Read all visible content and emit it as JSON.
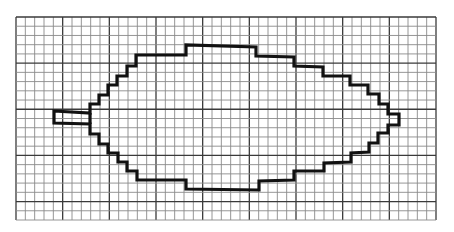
{
  "figure": {
    "width": 454,
    "height": 232,
    "background_color": "#ffffff"
  },
  "grid": {
    "left": 16,
    "top": 17,
    "right": 436,
    "bottom": 220,
    "cols": 45,
    "rows": 22,
    "major_every": 5,
    "minor_color": "#8a8a8a",
    "major_color": "#3a3a3a",
    "minor_width": 0.9,
    "major_width": 1.3
  },
  "shape": {
    "name": "leaf",
    "stroke_color": "#111111",
    "stroke_width": 3.2,
    "points": [
      [
        54,
        111
      ],
      [
        90,
        113
      ],
      [
        90,
        104
      ],
      [
        99,
        104
      ],
      [
        99,
        95
      ],
      [
        108,
        95
      ],
      [
        108,
        85
      ],
      [
        117,
        85
      ],
      [
        117,
        76
      ],
      [
        127,
        76
      ],
      [
        127,
        66
      ],
      [
        136,
        66
      ],
      [
        136,
        55
      ],
      [
        186,
        55
      ],
      [
        186,
        45
      ],
      [
        256,
        47
      ],
      [
        256,
        56
      ],
      [
        294,
        57
      ],
      [
        294,
        66
      ],
      [
        323,
        67
      ],
      [
        323,
        76
      ],
      [
        350,
        76
      ],
      [
        350,
        85
      ],
      [
        368,
        85
      ],
      [
        368,
        94
      ],
      [
        379,
        94
      ],
      [
        379,
        104
      ],
      [
        388,
        104
      ],
      [
        388,
        114
      ],
      [
        399,
        114
      ],
      [
        399,
        125
      ],
      [
        388,
        125
      ],
      [
        388,
        133
      ],
      [
        378,
        133
      ],
      [
        378,
        143
      ],
      [
        369,
        143
      ],
      [
        369,
        152
      ],
      [
        351,
        153
      ],
      [
        351,
        162
      ],
      [
        324,
        163
      ],
      [
        324,
        171
      ],
      [
        294,
        171
      ],
      [
        294,
        180
      ],
      [
        259,
        181
      ],
      [
        259,
        190
      ],
      [
        186,
        189
      ],
      [
        186,
        180
      ],
      [
        137,
        180
      ],
      [
        137,
        171
      ],
      [
        127,
        171
      ],
      [
        127,
        162
      ],
      [
        118,
        162
      ],
      [
        118,
        153
      ],
      [
        108,
        153
      ],
      [
        108,
        144
      ],
      [
        99,
        144
      ],
      [
        99,
        134
      ],
      [
        90,
        134
      ],
      [
        90,
        124
      ],
      [
        54,
        123
      ]
    ],
    "stem_divider": [
      [
        90,
        113
      ],
      [
        90,
        124
      ]
    ]
  }
}
